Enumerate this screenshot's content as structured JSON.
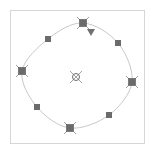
{
  "canvas": {
    "width": 163,
    "height": 146,
    "background": "#ffffff"
  },
  "frame": {
    "x": 10,
    "y": 10,
    "width": 134,
    "height": 133,
    "stroke": "#d6d6d6"
  },
  "shape": {
    "type": "circle-outline",
    "stroke": "#c8c8c8",
    "points": [
      [
        83,
        23
      ],
      [
        118,
        43
      ],
      [
        132,
        82
      ],
      [
        109,
        115
      ],
      [
        70,
        128
      ],
      [
        37,
        107
      ],
      [
        22,
        71
      ],
      [
        48,
        39
      ]
    ]
  },
  "colors": {
    "handle_fill": "#6b6b6b",
    "handle_stroke": "#8a8a8a",
    "marker_fill": "#707070"
  },
  "handles": {
    "vertex": [
      {
        "name": "vertex-handle-top",
        "x": 83,
        "y": 23
      },
      {
        "name": "vertex-handle-right",
        "x": 132,
        "y": 82
      },
      {
        "name": "vertex-handle-bottom",
        "x": 70,
        "y": 128
      },
      {
        "name": "vertex-handle-left",
        "x": 22,
        "y": 71
      }
    ],
    "midpoint": [
      {
        "name": "midpoint-handle-top-right",
        "x": 118,
        "y": 43
      },
      {
        "name": "midpoint-handle-bottom-right",
        "x": 109,
        "y": 115
      },
      {
        "name": "midpoint-handle-bottom-left",
        "x": 37,
        "y": 107
      },
      {
        "name": "midpoint-handle-top-left",
        "x": 48,
        "y": 39
      }
    ],
    "center": {
      "name": "center-handle",
      "x": 76,
      "y": 77
    },
    "start_marker": {
      "name": "start-triangle-marker",
      "x": 91,
      "y": 32
    }
  }
}
